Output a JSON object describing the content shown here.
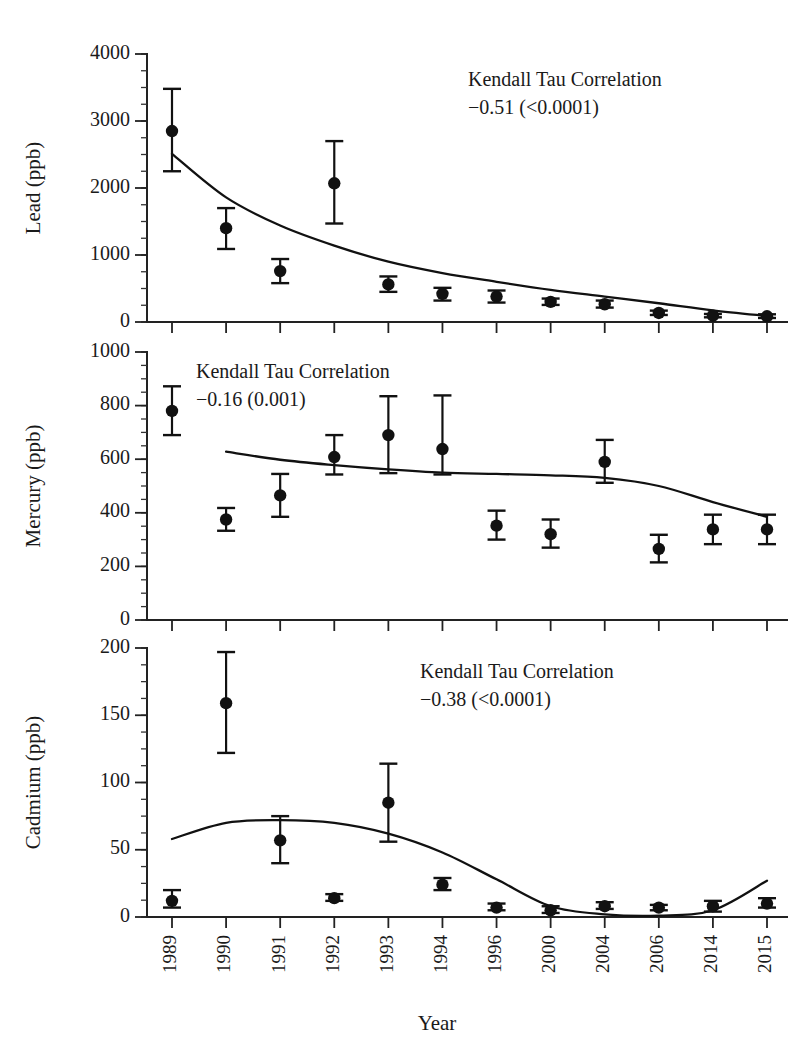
{
  "figure": {
    "xlabel": "Year",
    "categories": [
      "1989",
      "1990",
      "1991",
      "1992",
      "1993",
      "1994",
      "1996",
      "2000",
      "2004",
      "2006",
      "2014",
      "2015"
    ],
    "annotation_title": "Kendall Tau Correlation",
    "marker_color": "#111111",
    "line_color": "#111111",
    "axis_color": "#222222",
    "background_color": "#ffffff"
  },
  "chart_data": [
    {
      "type": "scatter",
      "title": "",
      "panel": "lead",
      "ylabel": "Lead (ppb)",
      "xlabel": "",
      "ylim": [
        0,
        4000
      ],
      "ytick_labels": [
        "0",
        "1000",
        "2000",
        "3000",
        "4000"
      ],
      "ytick_values": [
        0,
        1000,
        2000,
        3000,
        4000
      ],
      "yminor_step": 250,
      "grid": false,
      "legend": "none",
      "categories": [
        "1989",
        "1990",
        "1991",
        "1992",
        "1993",
        "1994",
        "1996",
        "2000",
        "2004",
        "2006",
        "2014",
        "2015"
      ],
      "values": [
        2850,
        1400,
        760,
        2070,
        560,
        420,
        380,
        300,
        265,
        135,
        95,
        85
      ],
      "err_low": [
        2250,
        1090,
        580,
        1470,
        450,
        320,
        290,
        255,
        215,
        105,
        70,
        60
      ],
      "err_high": [
        3480,
        1700,
        940,
        2700,
        680,
        510,
        470,
        350,
        320,
        170,
        120,
        115
      ],
      "annotation": {
        "line1": "Kendall Tau Correlation",
        "line2": "−0.51 (<0.0001)",
        "tau": -0.51,
        "p_value": "<0.0001"
      },
      "fit_curve": [
        [
          0,
          2510
        ],
        [
          1,
          1860
        ],
        [
          2,
          1440
        ],
        [
          3,
          1140
        ],
        [
          4,
          900
        ],
        [
          5,
          730
        ],
        [
          6,
          600
        ],
        [
          7,
          480
        ],
        [
          8,
          380
        ],
        [
          9,
          280
        ],
        [
          10,
          175
        ],
        [
          11,
          90
        ]
      ]
    },
    {
      "type": "scatter",
      "title": "",
      "panel": "mercury",
      "ylabel": "Mercury (ppb)",
      "xlabel": "",
      "ylim": [
        0,
        1000
      ],
      "ytick_labels": [
        "0",
        "200",
        "400",
        "600",
        "800",
        "1000"
      ],
      "ytick_values": [
        0,
        200,
        400,
        600,
        800,
        1000
      ],
      "yminor_step": 50,
      "grid": false,
      "legend": "none",
      "categories": [
        "1989",
        "1990",
        "1991",
        "1992",
        "1993",
        "1994",
        "1996",
        "2000",
        "2004",
        "2006",
        "2014",
        "2015"
      ],
      "values": [
        780,
        375,
        465,
        608,
        690,
        638,
        352,
        320,
        590,
        265,
        338,
        338
      ],
      "err_low": [
        690,
        333,
        385,
        543,
        548,
        543,
        300,
        270,
        512,
        215,
        283,
        283
      ],
      "err_high": [
        872,
        418,
        545,
        690,
        835,
        838,
        408,
        375,
        672,
        318,
        393,
        393
      ],
      "annotation": {
        "line1": "Kendall Tau Correlation",
        "line2": "−0.16 (0.001)",
        "tau": -0.16,
        "p_value": "0.001"
      },
      "fit_curve": [
        [
          1,
          628
        ],
        [
          2,
          598
        ],
        [
          3,
          578
        ],
        [
          4,
          562
        ],
        [
          5,
          550
        ],
        [
          6,
          545
        ],
        [
          7,
          540
        ],
        [
          8,
          530
        ],
        [
          9,
          500
        ],
        [
          10,
          440
        ],
        [
          11,
          385
        ]
      ]
    },
    {
      "type": "scatter",
      "title": "",
      "panel": "cadmium",
      "ylabel": "Cadmium (ppb)",
      "xlabel": "Year",
      "ylim": [
        0,
        200
      ],
      "ytick_labels": [
        "0",
        "50",
        "100",
        "150",
        "200"
      ],
      "ytick_values": [
        0,
        50,
        100,
        150,
        200
      ],
      "yminor_step": 12.5,
      "grid": false,
      "legend": "none",
      "categories": [
        "1989",
        "1990",
        "1991",
        "1992",
        "1993",
        "1994",
        "1996",
        "2000",
        "2004",
        "2006",
        "2014",
        "2015"
      ],
      "values": [
        12,
        159,
        57,
        14,
        85,
        24,
        7,
        5,
        8,
        7,
        8,
        10
      ],
      "err_low": [
        7,
        122,
        40,
        12,
        56,
        20,
        5,
        3,
        6,
        5,
        4,
        7
      ],
      "err_high": [
        20,
        197,
        75,
        17,
        114,
        29,
        10,
        8,
        11,
        9,
        12,
        14
      ],
      "annotation": {
        "line1": "Kendall Tau Correlation",
        "line2": "−0.38 (<0.0001)",
        "tau": -0.38,
        "p_value": "<0.0001"
      },
      "fit_curve": [
        [
          0,
          58
        ],
        [
          1,
          70
        ],
        [
          2,
          72
        ],
        [
          3,
          70
        ],
        [
          4,
          62
        ],
        [
          5,
          48
        ],
        [
          6,
          28
        ],
        [
          7,
          8
        ],
        [
          8,
          2
        ],
        [
          9,
          1
        ],
        [
          10,
          5
        ],
        [
          11,
          27
        ]
      ]
    }
  ]
}
